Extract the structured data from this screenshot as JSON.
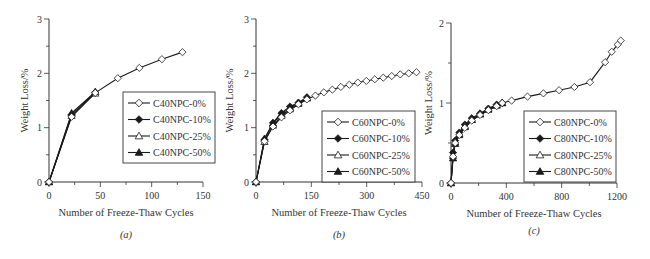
{
  "chart_data": [
    {
      "type": "line",
      "panel_label": "(a)",
      "xlabel": "Number of Freeze-Thaw Cycles",
      "ylabel": "Weight Loss/%",
      "xlim": [
        0,
        150
      ],
      "ylim": [
        0,
        3
      ],
      "x_ticks": [
        0,
        50,
        100,
        150
      ],
      "x_minor_step": 25,
      "y_ticks": [
        0,
        1,
        2,
        3
      ],
      "y_minor_step": 0.5,
      "grid": false,
      "legend_position": "center-right",
      "series": [
        {
          "name": "C40NPC-0%",
          "marker": "diamond-open",
          "x": [
            0,
            22,
            45,
            67,
            88,
            110,
            130
          ],
          "values": [
            0,
            1.2,
            1.64,
            1.91,
            2.1,
            2.26,
            2.39
          ]
        },
        {
          "name": "C40NPC-10%",
          "marker": "diamond-filled",
          "x": [
            0,
            22,
            45
          ],
          "values": [
            0,
            1.24,
            1.65
          ]
        },
        {
          "name": "C40NPC-25%",
          "marker": "triangle-open",
          "x": [
            0,
            22,
            45
          ],
          "values": [
            0,
            1.22,
            1.63
          ]
        },
        {
          "name": "C40NPC-50%",
          "marker": "triangle-filled",
          "x": [
            0,
            22,
            45
          ],
          "values": [
            0,
            1.27,
            1.66
          ]
        }
      ]
    },
    {
      "type": "line",
      "panel_label": "(b)",
      "xlabel": "Number of Freeze-Thaw Cycles",
      "ylabel": "Weight Loss/%",
      "xlim": [
        0,
        450
      ],
      "ylim": [
        0,
        3
      ],
      "x_ticks": [
        0,
        150,
        300,
        450
      ],
      "x_minor_step": 75,
      "y_ticks": [
        0,
        1,
        2,
        3
      ],
      "y_minor_step": 0.5,
      "grid": false,
      "legend_position": "center-right",
      "series": [
        {
          "name": "C60NPC-0%",
          "marker": "diamond-open",
          "x": [
            0,
            23,
            46,
            69,
            92,
            115,
            138,
            161,
            184,
            207,
            230,
            253,
            276,
            299,
            322,
            345,
            368,
            391,
            414,
            435
          ],
          "values": [
            0,
            0.75,
            1.02,
            1.19,
            1.32,
            1.43,
            1.52,
            1.59,
            1.65,
            1.7,
            1.75,
            1.79,
            1.83,
            1.86,
            1.89,
            1.92,
            1.95,
            1.98,
            2.0,
            2.02
          ]
        },
        {
          "name": "C60NPC-10%",
          "marker": "diamond-filled",
          "x": [
            0,
            23,
            46,
            69,
            92,
            115,
            138
          ],
          "values": [
            0,
            0.78,
            1.09,
            1.27,
            1.39,
            1.46,
            1.56
          ]
        },
        {
          "name": "C60NPC-25%",
          "marker": "triangle-open",
          "x": [
            0,
            23,
            46,
            69,
            92,
            115,
            138
          ],
          "values": [
            0,
            0.74,
            1.04,
            1.22,
            1.34,
            1.44,
            1.54
          ]
        },
        {
          "name": "C60NPC-50%",
          "marker": "triangle-filled",
          "x": [
            0,
            23,
            46,
            69,
            92,
            115,
            138
          ],
          "values": [
            0,
            0.8,
            1.08,
            1.25,
            1.37,
            1.46,
            1.55
          ]
        }
      ]
    },
    {
      "type": "line",
      "panel_label": "(c)",
      "xlabel": "Number of Freeze-Thaw Cycles",
      "ylabel": "Weight Loss/%",
      "xlim": [
        0,
        1200
      ],
      "ylim": [
        0,
        2
      ],
      "x_ticks": [
        0,
        400,
        800,
        1200
      ],
      "x_minor_step": 200,
      "y_ticks": [
        0,
        1,
        2
      ],
      "y_minor_step": 0.5,
      "grid": false,
      "legend_position": "lower-right",
      "series": [
        {
          "name": "C80NPC-0%",
          "marker": "diamond-open",
          "x": [
            0,
            15,
            30,
            60,
            100,
            150,
            210,
            270,
            330,
            370,
            438,
            553,
            668,
            781,
            892,
            1005,
            1114,
            1162,
            1205,
            1227
          ],
          "values": [
            0,
            0.33,
            0.5,
            0.6,
            0.69,
            0.78,
            0.85,
            0.91,
            0.96,
            1.0,
            1.03,
            1.08,
            1.12,
            1.16,
            1.2,
            1.26,
            1.51,
            1.64,
            1.73,
            1.78
          ]
        },
        {
          "name": "C80NPC-10%",
          "marker": "diamond-filled",
          "x": [
            0,
            15,
            30,
            60,
            100,
            150,
            210,
            270,
            330,
            370
          ],
          "values": [
            0,
            0.38,
            0.53,
            0.63,
            0.73,
            0.81,
            0.87,
            0.93,
            0.98,
            1.0
          ]
        },
        {
          "name": "C80NPC-25%",
          "marker": "triangle-open",
          "x": [
            0,
            15,
            30,
            60,
            100,
            150,
            210,
            270,
            330,
            370
          ],
          "values": [
            0,
            0.34,
            0.51,
            0.61,
            0.71,
            0.79,
            0.86,
            0.92,
            0.97,
            1.0
          ]
        },
        {
          "name": "C80NPC-50%",
          "marker": "triangle-filled",
          "x": [
            0,
            15,
            30,
            60,
            100,
            150,
            210,
            270,
            330,
            370
          ],
          "values": [
            0,
            0.31,
            0.49,
            0.6,
            0.7,
            0.79,
            0.86,
            0.92,
            0.97,
            1.0
          ]
        }
      ]
    }
  ],
  "layout": {
    "panels": [
      {
        "x0": 49,
        "x1": 203,
        "y0": 182,
        "y1": 19,
        "legend": {
          "x": 123,
          "y": 92,
          "w": 92,
          "h": 71
        },
        "ylabel_x": 28,
        "panel_label_y": 238
      },
      {
        "x0": 256,
        "x1": 422,
        "y0": 182,
        "y1": 19,
        "legend": {
          "x": 322,
          "y": 111,
          "w": 93,
          "h": 71
        },
        "ylabel_x": 233,
        "panel_label_y": 238
      },
      {
        "x0": 451,
        "x1": 617,
        "y0": 183,
        "y1": 23,
        "legend": {
          "x": 524,
          "y": 111,
          "w": 92,
          "h": 71
        },
        "ylabel_x": 432,
        "panel_label_y": 234
      }
    ],
    "line_color": "#1a1a1a"
  }
}
